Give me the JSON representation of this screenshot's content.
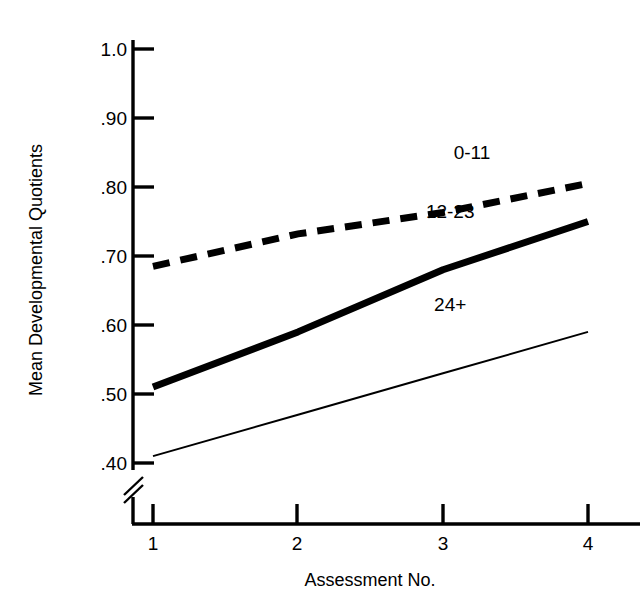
{
  "chart_data": {
    "type": "line",
    "title": "",
    "subtitle": "",
    "xlabel": "Assessment No.",
    "ylabel": "Mean Developmental Quotients",
    "x": [
      1,
      2,
      3,
      4
    ],
    "categories": [
      "1",
      "2",
      "3",
      "4"
    ],
    "xtick_labels": [
      "1",
      "2",
      "3",
      "4"
    ],
    "ytick_labels": [
      ".40",
      ".50",
      ".60",
      ".70",
      ".80",
      ".90",
      "1.0"
    ],
    "ytick_values": [
      0.4,
      0.5,
      0.6,
      0.7,
      0.8,
      0.9,
      1.0
    ],
    "xlim": [
      1,
      4
    ],
    "ylim": [
      0.4,
      1.0
    ],
    "grid": false,
    "legend_position": "inline-annotations",
    "axis_break": {
      "axis": "y",
      "below_value": 0.4,
      "symbol": "double-slash"
    },
    "series": [
      {
        "name": "0-11",
        "label": "0-11",
        "style": "dashed",
        "line_width": 7,
        "color": "#000000",
        "values": [
          0.685,
          0.732,
          0.763,
          0.805
        ],
        "label_x": 3.2,
        "label_y": 0.84
      },
      {
        "name": "12-23",
        "label": "12-23",
        "style": "solid",
        "line_width": 7,
        "color": "#000000",
        "values": [
          0.51,
          0.59,
          0.68,
          0.75
        ],
        "label_x": 3.05,
        "label_y": 0.755
      },
      {
        "name": "24+",
        "label": "24+",
        "style": "solid",
        "line_width": 2,
        "color": "#000000",
        "values": [
          0.41,
          0.47,
          0.53,
          0.59
        ],
        "label_x": 3.05,
        "label_y": 0.62
      }
    ]
  },
  "axes": {
    "y_title": "Mean Developmental Quotients",
    "x_title": "Assessment No.",
    "y_labels": {
      "t1": "1.0",
      "t2": ".90",
      "t3": ".80",
      "t4": ".70",
      "t5": ".60",
      "t6": ".50",
      "t7": ".40"
    },
    "x_labels": {
      "t1": "1",
      "t2": "2",
      "t3": "3",
      "t4": "4"
    }
  },
  "annotations": {
    "series_0_11": "0-11",
    "series_12_23": "12-23",
    "series_24_plus": "24+"
  },
  "colors": {
    "background": "#ffffff",
    "ink": "#000000",
    "axis": "#000000"
  }
}
